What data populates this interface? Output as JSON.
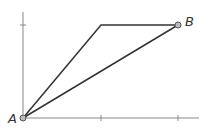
{
  "diagram": {
    "type": "path-comparison",
    "points": {
      "A": {
        "label": "A",
        "x": 23,
        "y": 118
      },
      "B": {
        "label": "B",
        "x": 178,
        "y": 25
      },
      "corner": {
        "x": 101,
        "y": 25
      }
    },
    "axes": {
      "x_axis": {
        "x1": 23,
        "x2": 199,
        "y": 118,
        "ticks": [
          101,
          178
        ]
      },
      "y_axis": {
        "x": 23,
        "y1": 12,
        "y2": 118,
        "ticks": [
          25
        ]
      }
    },
    "paths": [
      {
        "name": "bent-path",
        "points": [
          [
            23,
            118
          ],
          [
            101,
            25
          ],
          [
            178,
            25
          ]
        ]
      },
      {
        "name": "straight-path",
        "points": [
          [
            23,
            118
          ],
          [
            178,
            25
          ]
        ]
      }
    ],
    "colors": {
      "axis": "#888888",
      "path": "#333333",
      "point_fill": "#bbbbbb",
      "point_stroke": "#555555"
    }
  }
}
